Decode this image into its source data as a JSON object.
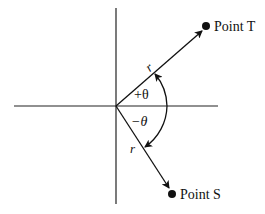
{
  "diagram": {
    "points": {
      "T": {
        "label": "Point T"
      },
      "S": {
        "label": "Point S"
      }
    },
    "vectors": {
      "upper_r": "r",
      "lower_r": "r"
    },
    "angles": {
      "positive": "+θ",
      "negative": "−θ"
    }
  }
}
